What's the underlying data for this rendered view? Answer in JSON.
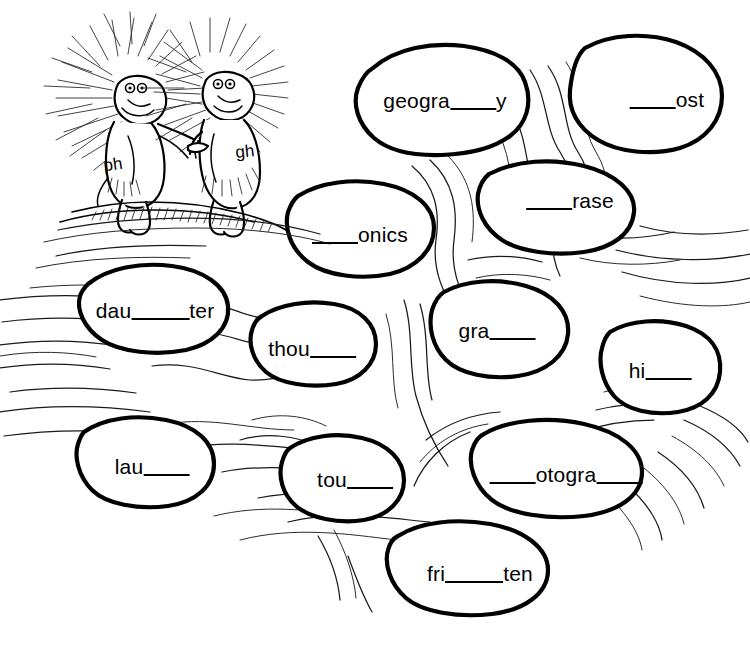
{
  "page": {
    "background_color": "#ffffff",
    "ink_color": "#000000",
    "width": 750,
    "height": 648
  },
  "illustration": {
    "name": "two-porcupines-holding-hands",
    "characters": [
      {
        "name": "porcupine-ph",
        "body_letters": "ph"
      },
      {
        "name": "porcupine-gh",
        "body_letters": "gh"
      }
    ],
    "background_motif": "flowing-water-lines-with-stepping-stones"
  },
  "stones": [
    {
      "id": "stone-geography",
      "text": "geogra___y",
      "parts": [
        "geogra",
        "blank-md",
        "y"
      ],
      "cx": 445,
      "cy": 101
    },
    {
      "id": "stone-ghost",
      "text": "___ost",
      "parts": [
        "blank-md",
        "ost"
      ],
      "cx": 667,
      "cy": 100
    },
    {
      "id": "stone-phrase",
      "text": "___rase",
      "parts": [
        "blank-md",
        "rase"
      ],
      "cx": 570,
      "cy": 201
    },
    {
      "id": "stone-phonics",
      "text": "___onics",
      "parts": [
        "blank-md",
        "onics"
      ],
      "cx": 360,
      "cy": 235
    },
    {
      "id": "stone-daughter",
      "text": "dau___ter",
      "parts": [
        "dau",
        "blank-lg",
        "ter"
      ],
      "cx": 155,
      "cy": 311
    },
    {
      "id": "stone-though",
      "text": "thou___",
      "parts": [
        "thou",
        "blank-md"
      ],
      "cx": 312,
      "cy": 349
    },
    {
      "id": "stone-graph",
      "text": "gra___",
      "parts": [
        "gra",
        "blank-md"
      ],
      "cx": 497,
      "cy": 331
    },
    {
      "id": "stone-high",
      "text": "hi___",
      "parts": [
        "hi",
        "blank-md"
      ],
      "cx": 660,
      "cy": 371
    },
    {
      "id": "stone-laugh",
      "text": "lau___",
      "parts": [
        "lau",
        "blank-md"
      ],
      "cx": 152,
      "cy": 467
    },
    {
      "id": "stone-tough",
      "text": "tou___",
      "parts": [
        "tou",
        "blank-md"
      ],
      "cx": 355,
      "cy": 480
    },
    {
      "id": "stone-photograph",
      "text": "___otogra___",
      "parts": [
        "blank-md",
        "otogra",
        "blank-md"
      ],
      "cx": 566,
      "cy": 475
    },
    {
      "id": "stone-frighten",
      "text": "fri___ten",
      "parts": [
        "fri",
        "blank-lg",
        "ten"
      ],
      "cx": 480,
      "cy": 574
    }
  ]
}
